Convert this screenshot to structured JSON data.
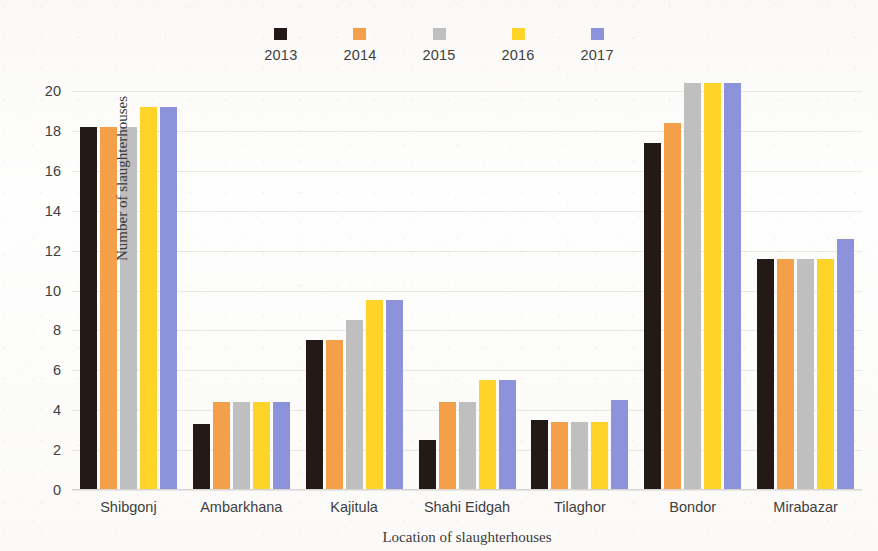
{
  "chart_data": {
    "type": "bar",
    "title": "",
    "xlabel": "Location of slaughterhouses",
    "ylabel": "Number of slaughterhouses",
    "ylim": [
      0,
      20
    ],
    "ytick_step": 2,
    "yticks": [
      20,
      18,
      16,
      14,
      12,
      10,
      8,
      6,
      4,
      2,
      0
    ],
    "grid": true,
    "legend_position": "top",
    "categories": [
      "Shibgonj",
      "Ambarkhana",
      "Kajitula",
      "Shahi Eidgah",
      "Tilaghor",
      "Bondor",
      "Mirabazar"
    ],
    "series": [
      {
        "name": "2013",
        "color": "#231a16",
        "values": [
          18.2,
          3.3,
          7.5,
          2.5,
          3.5,
          17.4,
          11.6
        ]
      },
      {
        "name": "2014",
        "color": "#f4a04a",
        "values": [
          18.2,
          4.4,
          7.5,
          4.4,
          3.4,
          18.4,
          11.6
        ]
      },
      {
        "name": "2015",
        "color": "#bfbfbf",
        "values": [
          18.2,
          4.4,
          8.5,
          4.4,
          3.4,
          20.4,
          11.6
        ]
      },
      {
        "name": "2016",
        "color": "#ffd42a",
        "values": [
          19.2,
          4.4,
          9.5,
          5.5,
          3.4,
          20.4,
          11.6
        ]
      },
      {
        "name": "2017",
        "color": "#8c93db",
        "values": [
          19.2,
          4.4,
          9.5,
          5.5,
          4.5,
          20.4,
          12.6
        ]
      }
    ]
  }
}
